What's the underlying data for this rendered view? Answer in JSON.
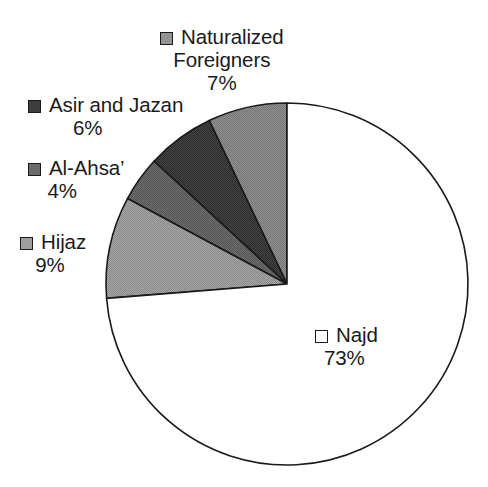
{
  "chart_data": {
    "type": "pie",
    "title": "",
    "subtitle": "",
    "xlabel": "",
    "ylabel": "",
    "legend_position": "callout-labels",
    "grid": false,
    "start_angle_deg": 90,
    "direction": "counterclockwise",
    "categories": [
      "Naturalized Foreigners",
      "Asir and Jazan",
      "Al-Ahsa’",
      "Hijaz",
      "Najd"
    ],
    "values": [
      7,
      6,
      4,
      9,
      73
    ],
    "value_labels": [
      "7%",
      "6%",
      "4%",
      "9%",
      "73%"
    ],
    "colors": [
      "#949494",
      "#3d3d3d",
      "#6b6b6b",
      "#9e9e9e",
      "#ffffff"
    ],
    "slice_outline_color": "#1a1a1a"
  },
  "legend": {
    "items": [
      {
        "key": "naturalized",
        "label_line1": "Naturalized",
        "label_line2": "Foreigners",
        "percent": "7%",
        "swatch_color": "#949494"
      },
      {
        "key": "asir",
        "label_line1": "Asir and Jazan",
        "label_line2": "",
        "percent": "6%",
        "swatch_color": "#3d3d3d"
      },
      {
        "key": "alahsa",
        "label_line1": "Al-Ahsa’",
        "label_line2": "",
        "percent": "4%",
        "swatch_color": "#6b6b6b"
      },
      {
        "key": "hijaz",
        "label_line1": "Hijaz",
        "label_line2": "",
        "percent": "9%",
        "swatch_color": "#9e9e9e"
      },
      {
        "key": "najd",
        "label_line1": "Najd",
        "label_line2": "",
        "percent": "73%",
        "swatch_color": "#ffffff"
      }
    ]
  },
  "geometry": {
    "center_x": 287,
    "center_y": 284,
    "radius": 181
  }
}
